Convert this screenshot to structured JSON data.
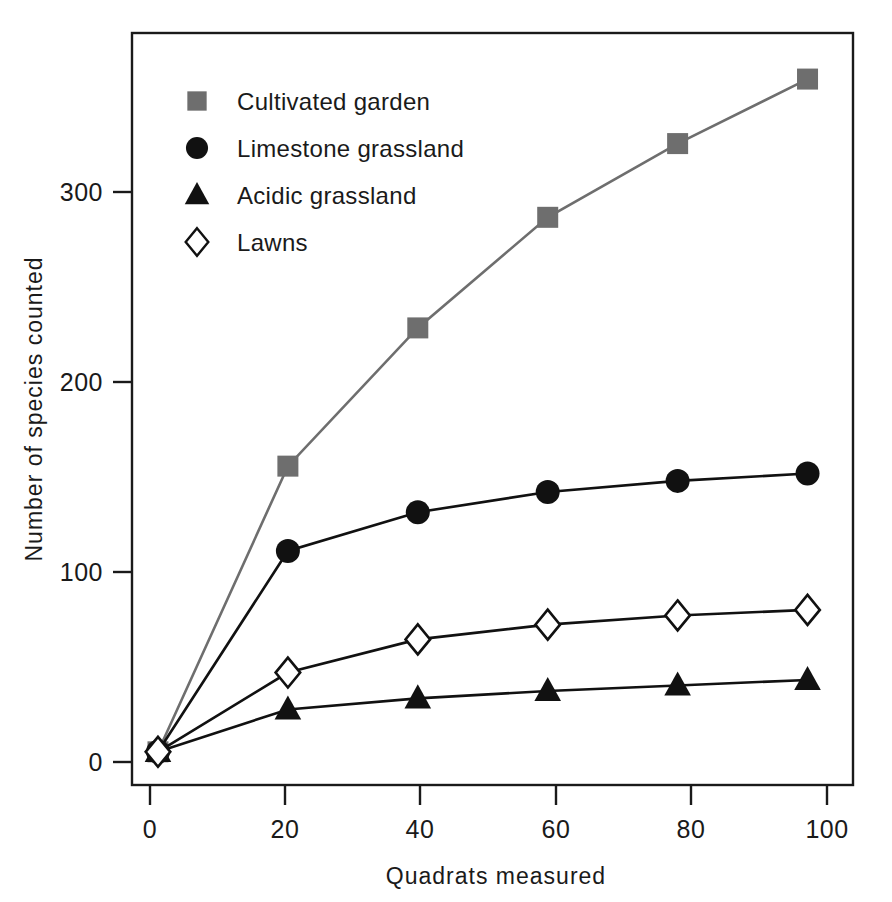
{
  "chart_data": {
    "type": "line",
    "title": "",
    "xlabel": "Quadrats measured",
    "ylabel": "Number of species counted",
    "x": [
      0,
      20,
      40,
      60,
      80,
      100
    ],
    "xlim": [
      -4,
      107
    ],
    "ylim": [
      -18,
      390
    ],
    "xticks": [
      0,
      20,
      40,
      60,
      80,
      100
    ],
    "yticks": [
      0,
      100,
      200,
      300
    ],
    "xtick_labels": [
      "0",
      "20",
      "40",
      "60",
      "80",
      "100"
    ],
    "ytick_labels": [
      "0",
      "100",
      "200",
      "300"
    ],
    "grid": false,
    "legend_position": "top-left",
    "series": [
      {
        "name": "Cultivated garden",
        "marker": "square-filled",
        "color": "#6e6e6e",
        "values": [
          0,
          155,
          230,
          290,
          330,
          365
        ]
      },
      {
        "name": "Limestone grassland",
        "marker": "circle-filled",
        "color": "#111111",
        "values": [
          0,
          109,
          130,
          141,
          147,
          151
        ]
      },
      {
        "name": "Acidic grassland",
        "marker": "triangle-filled",
        "color": "#111111",
        "values": [
          0,
          23,
          29,
          33,
          36,
          39
        ]
      },
      {
        "name": "Lawns",
        "marker": "diamond-open",
        "color": "#111111",
        "values": [
          0,
          43,
          61,
          69,
          74,
          77
        ]
      }
    ]
  },
  "legend": {
    "items": [
      {
        "label": "Cultivated garden",
        "marker": "square-filled",
        "color": "#6e6e6e"
      },
      {
        "label": "Limestone grassland",
        "marker": "circle-filled",
        "color": "#111111"
      },
      {
        "label": "Acidic grassland",
        "marker": "triangle-filled",
        "color": "#111111"
      },
      {
        "label": "Lawns",
        "marker": "diamond-open",
        "color": "#111111"
      }
    ]
  },
  "axes": {
    "x_title": "Quadrats measured",
    "y_title": "Number of species counted",
    "x_tick_labels": [
      "0",
      "20",
      "40",
      "60",
      "80",
      "100"
    ],
    "y_tick_labels": [
      "0",
      "100",
      "200",
      "300"
    ],
    "frame_color": "#1a1a1a"
  }
}
